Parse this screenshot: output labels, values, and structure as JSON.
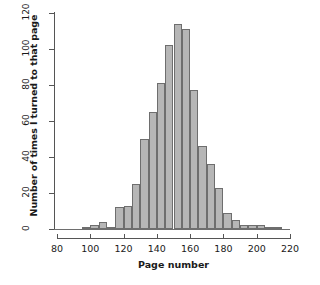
{
  "chart_data": {
    "type": "bar",
    "title": "",
    "subtitle": "",
    "xlabel": "Page number",
    "ylabel": "Number of times I turned to that page",
    "xlim": [
      80,
      220
    ],
    "ylim": [
      0,
      120
    ],
    "xticks": [
      80,
      100,
      120,
      140,
      160,
      180,
      200,
      220
    ],
    "yticks": [
      0,
      20,
      40,
      60,
      80,
      100,
      120
    ],
    "grid": false,
    "legend": null,
    "bin_width": 5,
    "bin_starts": [
      95,
      100,
      105,
      110,
      115,
      120,
      125,
      130,
      135,
      140,
      145,
      150,
      155,
      160,
      165,
      170,
      175,
      180,
      185,
      190,
      195,
      200,
      205,
      210
    ],
    "categories": [
      "95-100",
      "100-105",
      "105-110",
      "110-115",
      "115-120",
      "120-125",
      "125-130",
      "130-135",
      "135-140",
      "140-145",
      "145-150",
      "150-155",
      "155-160",
      "160-165",
      "165-170",
      "170-175",
      "175-180",
      "180-185",
      "185-190",
      "190-195",
      "195-200",
      "200-205",
      "205-210",
      "210-215"
    ],
    "values": [
      1,
      2,
      4,
      1,
      12,
      13,
      25,
      50,
      65,
      81,
      102,
      114,
      111,
      77,
      46,
      36,
      23,
      9,
      5,
      2,
      2,
      2,
      1,
      1
    ],
    "bar_color": "#b6b6b6",
    "bar_border_color": "#6e6e6e",
    "axis_color": "#555555"
  },
  "axes": {
    "y_title": "Number of times I turned to that page",
    "x_title": "Page number"
  }
}
